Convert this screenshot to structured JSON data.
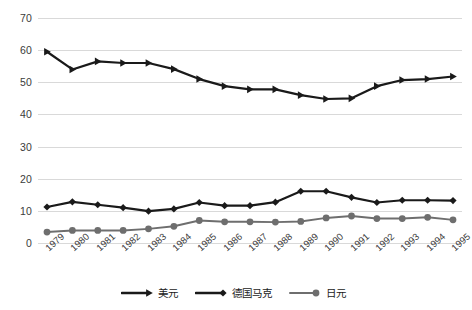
{
  "chart_data": {
    "type": "line",
    "title": "",
    "subtitle": "",
    "xlabel": "",
    "ylabel": "",
    "categories": [
      "1979",
      "1980",
      "1981",
      "1982",
      "1983",
      "1984",
      "1985",
      "1986",
      "1987",
      "1988",
      "1989",
      "1990",
      "1991",
      "1992",
      "1993",
      "1994",
      "1995"
    ],
    "ylim": [
      0,
      70
    ],
    "yticks": [
      0,
      10,
      20,
      30,
      40,
      50,
      60,
      70
    ],
    "grid": true,
    "legend_position": "bottom",
    "series": [
      {
        "name": "美元",
        "color": "#1a1a1a",
        "marker": "triangle-right",
        "values": [
          59.5,
          54.0,
          56.5,
          56.0,
          56.0,
          54.1,
          51.0,
          48.8,
          47.8,
          47.8,
          46.0,
          44.8,
          45.0,
          48.8,
          50.7,
          51.0,
          51.8
        ]
      },
      {
        "name": "德国马克",
        "color": "#1a1a1a",
        "marker": "diamond",
        "values": [
          11.2,
          12.8,
          11.9,
          11.0,
          9.9,
          10.6,
          12.6,
          11.6,
          11.6,
          12.7,
          16.1,
          16.1,
          14.2,
          12.6,
          13.3,
          13.3,
          13.2
        ]
      },
      {
        "name": "日元",
        "color": "#6e6e6e",
        "marker": "circle",
        "values": [
          3.4,
          3.9,
          3.9,
          3.9,
          4.4,
          5.2,
          7.0,
          6.6,
          6.6,
          6.5,
          6.7,
          7.8,
          8.4,
          7.6,
          7.6,
          8.0,
          7.2
        ]
      }
    ]
  },
  "axes": {
    "y_tick_labels": [
      "70",
      "60",
      "50",
      "40",
      "30",
      "20",
      "10",
      "0"
    ],
    "x_tick_labels": [
      "1979",
      "1980",
      "1981",
      "1982",
      "1983",
      "1984",
      "1985",
      "1986",
      "1987",
      "1988",
      "1989",
      "1990",
      "1991",
      "1992",
      "1993",
      "1994",
      "1995"
    ]
  },
  "legend": {
    "items": [
      {
        "label": "美元",
        "color": "#1a1a1a",
        "marker": "triangle-right"
      },
      {
        "label": "德国马克",
        "color": "#1a1a1a",
        "marker": "diamond"
      },
      {
        "label": "日元",
        "color": "#6e6e6e",
        "marker": "circle"
      }
    ]
  },
  "colors": {
    "background": "#ffffff",
    "gridline": "#d9d9d9",
    "axis_text": "#3b3b3b",
    "series_dark": "#1a1a1a",
    "series_gray": "#6e6e6e"
  }
}
